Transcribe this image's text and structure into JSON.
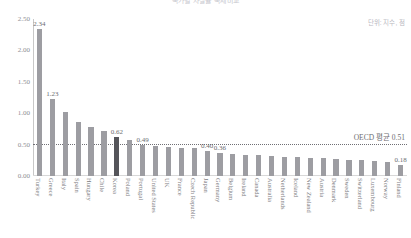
{
  "chart": {
    "title": "국가별 자살률 국제비교",
    "unit_note": "단위: 지수, 점",
    "avg_label": "OECD 평균 0.51"
  },
  "chart_data": {
    "type": "bar",
    "title": "국가별 자살률 국제비교",
    "xlabel": "",
    "ylabel": "",
    "ylim": [
      0.0,
      2.5
    ],
    "yticks": [
      "0.00",
      "0.50",
      "1.00",
      "1.50",
      "2.00",
      "2.50"
    ],
    "ytick_values": [
      0.0,
      0.5,
      1.0,
      1.5,
      2.0,
      2.5
    ],
    "grid": false,
    "legend": "none",
    "reference_line": {
      "label": "OECD 평균 0.51",
      "value": 0.51,
      "style": "dotted"
    },
    "highlight_category": "Korea",
    "colors": {
      "bar": "#9d9da2",
      "bar_highlight": "#55555a",
      "reference_line": "#6f6f74",
      "text": "#7d7d82"
    },
    "categories": [
      "Turkey",
      "Greece",
      "Italy",
      "Spain",
      "Hungary",
      "Chile",
      "Korea",
      "Poland",
      "Portugal",
      "United States",
      "UK",
      "France",
      "Czech Republic",
      "Japan",
      "Germany",
      "Belgium",
      "Ireland",
      "Canada",
      "Australia",
      "Netherlands",
      "Iceland",
      "New Zealand",
      "Austria",
      "Denmark",
      "Sweden",
      "Switzerland",
      "Luxembourg",
      "Norway",
      "Finland"
    ],
    "values": [
      2.34,
      1.23,
      1.02,
      0.86,
      0.78,
      0.72,
      0.62,
      0.58,
      0.49,
      0.47,
      0.46,
      0.45,
      0.44,
      0.4,
      0.36,
      0.35,
      0.34,
      0.33,
      0.32,
      0.31,
      0.3,
      0.29,
      0.28,
      0.27,
      0.26,
      0.25,
      0.24,
      0.22,
      0.18
    ],
    "labeled_points": [
      {
        "category": "Turkey",
        "value": 2.34,
        "label": "2.34"
      },
      {
        "category": "Greece",
        "value": 1.23,
        "label": "1.23"
      },
      {
        "category": "Korea",
        "value": 0.62,
        "label": "0.62"
      },
      {
        "category": "Portugal",
        "value": 0.49,
        "label": "0.49"
      },
      {
        "category": "Japan",
        "value": 0.4,
        "label": "0.40"
      },
      {
        "category": "Germany",
        "value": 0.36,
        "label": "0.36"
      },
      {
        "category": "Finland",
        "value": 0.18,
        "label": "0.18"
      }
    ]
  }
}
